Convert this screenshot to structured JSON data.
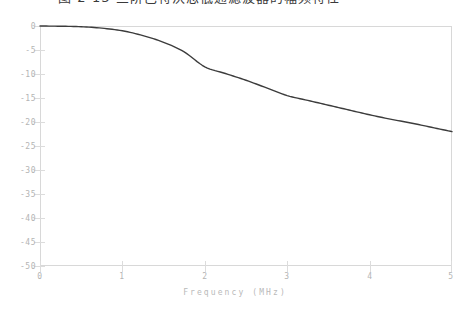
{
  "top_strip": {
    "clipped_text": "图 2-13   三阶巴特沃思低通滤波器的幅频特性"
  },
  "chart": {
    "xlabel": "Frequency  (MHz)",
    "ylabel": "",
    "title": "",
    "x_ticks": [
      "0",
      "1",
      "2",
      "3",
      "4",
      "5"
    ],
    "y_ticks": [
      "0",
      "-5",
      "-10",
      "-15",
      "-20",
      "-25",
      "-30",
      "-35",
      "-40",
      "-45",
      "-50"
    ],
    "colors": {
      "curve": "#3c3c3c",
      "frame": "#d8d8d8",
      "tick": "#dcdcdc",
      "tick_label": "#b4b4b4",
      "axis_label": "#b9b9b9",
      "background": "#ffffff"
    }
  },
  "chart_data": {
    "type": "line",
    "title": "",
    "xlabel": "Frequency  (MHz)",
    "ylabel": "",
    "xlim": [
      0,
      5
    ],
    "ylim": [
      -50,
      0
    ],
    "xticks": [
      0,
      1,
      2,
      3,
      4,
      5
    ],
    "yticks": [
      0,
      -5,
      -10,
      -15,
      -20,
      -25,
      -30,
      -35,
      -40,
      -45,
      -50
    ],
    "grid": false,
    "legend": null,
    "series": [
      {
        "name": "Magnitude response (dB)",
        "color": "#3c3c3c",
        "x": [
          0.0,
          0.25,
          0.5,
          0.75,
          1.0,
          1.25,
          1.5,
          1.75,
          2.0,
          2.25,
          2.5,
          2.75,
          3.0,
          3.25,
          3.5,
          3.75,
          4.0,
          4.25,
          4.5,
          4.75,
          5.0
        ],
        "y": [
          0.0,
          -0.05,
          -0.15,
          -0.45,
          -1.0,
          -2.0,
          -3.4,
          -5.4,
          -8.5,
          -9.9,
          -11.3,
          -12.9,
          -14.5,
          -15.5,
          -16.5,
          -17.5,
          -18.5,
          -19.4,
          -20.2,
          -21.1,
          -22.0
        ]
      }
    ]
  }
}
